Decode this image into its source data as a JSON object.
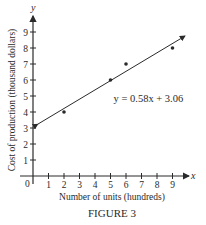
{
  "figure": {
    "caption": "FIGURE 3"
  },
  "chart_data": {
    "type": "scatter",
    "title": "",
    "xlabel": "Number of units (hundreds)",
    "ylabel": "Cost of production (thousand dollars)",
    "x_axis_symbol": "x",
    "y_axis_symbol": "y",
    "origin_label": "0",
    "xlim": [
      0,
      10
    ],
    "ylim": [
      0,
      10
    ],
    "x_ticks": [
      1,
      2,
      3,
      4,
      5,
      6,
      7,
      8,
      9
    ],
    "y_ticks": [
      1,
      2,
      3,
      4,
      5,
      6,
      7,
      8,
      9
    ],
    "grid": false,
    "legend": null,
    "series": [
      {
        "name": "data points",
        "points": [
          {
            "x": 2,
            "y": 4
          },
          {
            "x": 5,
            "y": 6
          },
          {
            "x": 6,
            "y": 7
          },
          {
            "x": 9,
            "y": 8
          }
        ]
      },
      {
        "name": "regression line",
        "type": "line",
        "equation": "y = 0.58x + 3.06",
        "slope": 0.58,
        "intercept": 3.06,
        "x_range": [
          0.3,
          9.8
        ]
      }
    ],
    "annotations": [
      {
        "text": "y = 0.58x + 3.06",
        "x": 5.2,
        "y": 4.6
      }
    ]
  }
}
